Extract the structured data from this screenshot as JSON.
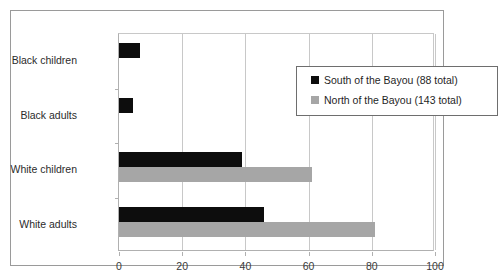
{
  "chart_data": {
    "type": "bar",
    "orientation": "horizontal",
    "title": "",
    "xlabel": "",
    "ylabel": "",
    "xlim": [
      0,
      100
    ],
    "xticks": [
      0,
      20,
      40,
      60,
      80,
      100
    ],
    "grid": true,
    "legend_position": "top-right-inside",
    "categories": [
      "Black children",
      "Black adults",
      "White children",
      "White adults"
    ],
    "series": [
      {
        "name": "South of the Bayou  (88 total)",
        "short_name": "South of the Bayou",
        "total": 88,
        "color": "#0d0d0d",
        "values": [
          6.5,
          4.3,
          39,
          46
        ]
      },
      {
        "name": "North of the Bayou (143 total)",
        "short_name": "North of the Bayou",
        "total": 143,
        "color": "#a6a6a6",
        "values": [
          0,
          0,
          61,
          81
        ]
      }
    ]
  },
  "axis": {
    "tick_labels": [
      "0",
      "20",
      "40",
      "60",
      "80",
      "100"
    ]
  },
  "categories": {
    "c0": "Black children",
    "c1": "Black adults",
    "c2": "White children",
    "c3": "White adults"
  },
  "legend": {
    "entries": [
      {
        "label": "South of the Bayou  (88 total)",
        "color": "#0d0d0d"
      },
      {
        "label": "North of the Bayou (143 total)",
        "color": "#a6a6a6"
      }
    ]
  },
  "colors": {
    "south": "#0d0d0d",
    "north": "#a6a6a6",
    "grid": "#c8c8c8",
    "axis": "#b0b0b0",
    "frame": "#9a9a9a",
    "text": "#2b2b2b"
  }
}
